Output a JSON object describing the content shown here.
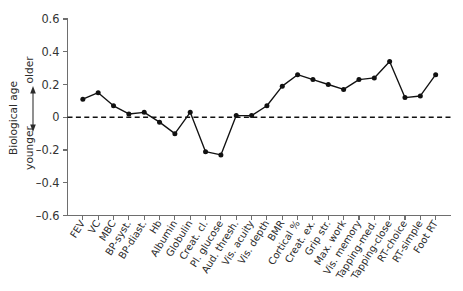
{
  "chart_data": {
    "type": "line",
    "title": "",
    "subtitle": "",
    "xlabel": "",
    "ylabel": "Biological age",
    "ylabel_axis_low": "younger",
    "ylabel_axis_high": "older",
    "ylim": [
      -0.6,
      0.6
    ],
    "yticks": [
      0.6,
      0.4,
      0.2,
      0,
      -0.2,
      -0.4,
      -0.6
    ],
    "ytick_labels": [
      "0.6",
      "0.4",
      "0.2",
      "0",
      "–0.2",
      "–0.4",
      "–0.6"
    ],
    "grid": false,
    "legend": null,
    "reference_line": {
      "y": 0,
      "style": "dashed"
    },
    "marker": "filled-circle",
    "categories": [
      "FEV",
      "VC",
      "MBC",
      "BP-syst.",
      "BP-diast.",
      "Hb",
      "Albumin",
      "Globulin",
      "Creat. cl.",
      "Pl. glucose",
      "Aud. thresh.",
      "Vis. acuity",
      "Vis. depth",
      "BMR",
      "Cortical %",
      "Creat. ex.",
      "Grip str.",
      "Max. work",
      "Vis. memory",
      "Tapping-med.",
      "Tapping-close",
      "RT-choice",
      "RT-simple",
      "Foot RT"
    ],
    "values": [
      0.11,
      0.15,
      0.07,
      0.02,
      0.03,
      -0.03,
      -0.1,
      0.03,
      -0.21,
      -0.23,
      0.01,
      0.01,
      0.07,
      0.19,
      0.26,
      0.23,
      0.2,
      0.17,
      0.23,
      0.24,
      0.34,
      0.12,
      0.13,
      0.26
    ],
    "colors": {
      "line": "#111111",
      "marker": "#111111",
      "axis": "#6e6e6e",
      "reference_line": "#111111",
      "background": "#ffffff",
      "text": "#2b2b2b"
    }
  }
}
